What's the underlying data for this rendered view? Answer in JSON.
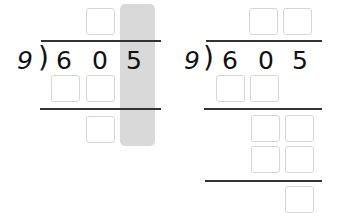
{
  "problems": [
    {
      "divisor": "9",
      "dividend_digits": [
        "6",
        "0",
        "5"
      ],
      "highlight_color": "#d9d9d9",
      "highlighted_column": 3,
      "boxes": {
        "quotient": 1,
        "first_product": 2,
        "remainder": 1
      }
    },
    {
      "divisor": "9",
      "dividend_digits": [
        "6",
        "0",
        "5"
      ],
      "boxes": {
        "quotient": 2,
        "first_product": 2,
        "bring_down": 2,
        "second_product": 2,
        "remainder": 1
      }
    }
  ],
  "symbols": {
    "paren": ")"
  }
}
